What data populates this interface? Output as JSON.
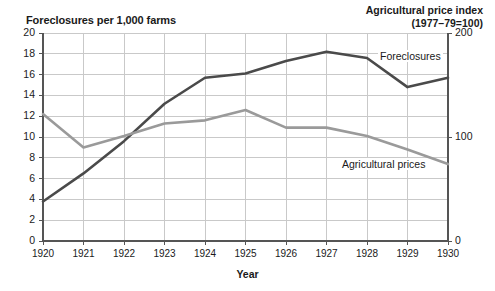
{
  "chart_data": {
    "type": "line",
    "title_left": "Foreclosures per 1,000 farms",
    "title_right_line1": "Agricultural price index",
    "title_right_line2": "(1977–79=100)",
    "xlabel": "Year",
    "categories": [
      "1920",
      "1921",
      "1922",
      "1923",
      "1924",
      "1925",
      "1926",
      "1927",
      "1928",
      "1929",
      "1930"
    ],
    "x": [
      1920,
      1921,
      1922,
      1923,
      1924,
      1925,
      1926,
      1927,
      1928,
      1929,
      1930
    ],
    "grid": true,
    "legend_position": "inline-annotation",
    "y_left": {
      "label": "Foreclosures per 1,000 farms",
      "ylim": [
        0,
        20
      ],
      "ticks": [
        0,
        2,
        4,
        6,
        8,
        10,
        12,
        14,
        16,
        18,
        20
      ],
      "tick_labels": [
        "0",
        "2",
        "4",
        "6",
        "8",
        "10",
        "12",
        "14",
        "16",
        "18",
        "20"
      ]
    },
    "y_right": {
      "label": "Agricultural price index (1977-79=100)",
      "ylim": [
        0,
        200
      ],
      "ticks": [
        0,
        100,
        200
      ],
      "tick_labels": [
        "0",
        "100",
        "200"
      ]
    },
    "series": [
      {
        "name": "Foreclosures",
        "axis": "left",
        "color": "#4a4a4a",
        "annotation": "Foreclosures",
        "values": [
          3.8,
          6.5,
          9.6,
          13.2,
          15.7,
          16.1,
          17.3,
          18.2,
          17.6,
          14.8,
          15.7
        ]
      },
      {
        "name": "Agricultural prices",
        "axis": "right",
        "color": "#9a9a9a",
        "annotation": "Agricultural prices",
        "values_left_scale": [
          12.2,
          9.0,
          10.1,
          11.3,
          11.6,
          12.6,
          10.9,
          10.9,
          10.1,
          8.8,
          7.4
        ],
        "values": [
          122,
          90,
          101,
          113,
          116,
          126,
          109,
          109,
          101,
          88,
          74
        ]
      }
    ],
    "colors": {
      "foreclosures_line": "#4a4a4a",
      "prices_line": "#9a9a9a",
      "grid": "#c9c9c9",
      "axis": "#555555",
      "text": "#1a1a1a",
      "background": "#ffffff"
    }
  }
}
